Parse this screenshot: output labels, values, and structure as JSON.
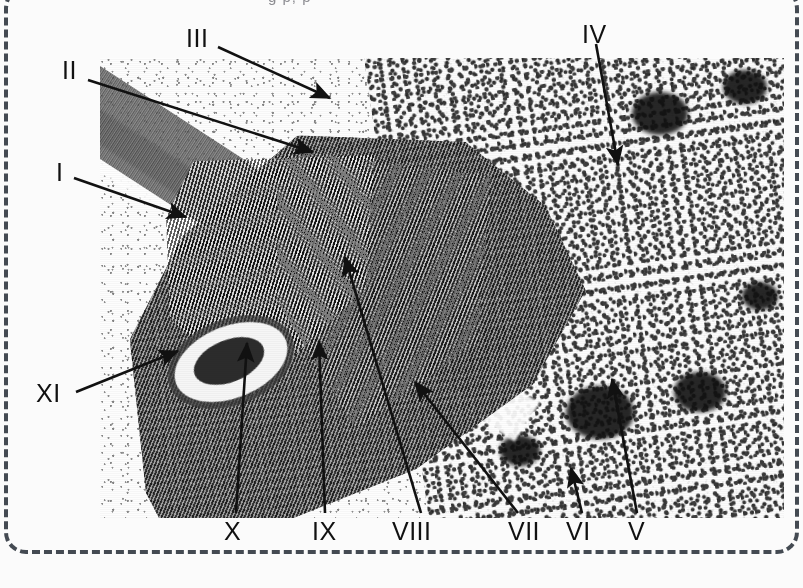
{
  "figure": {
    "kind": "labeled-electron-micrograph",
    "top_caption": "g p, p",
    "border": {
      "style": "dashed",
      "color": "#444a52",
      "corner": "rounded"
    },
    "micrograph": {
      "frame": {
        "x": 100,
        "y": 58,
        "width": 684,
        "height": 460
      },
      "palette": {
        "background": "#fbfbfb",
        "ink": "#111111",
        "film_light": "#fdfdfd",
        "film_dark": "#101010"
      }
    }
  },
  "labels": [
    {
      "id": "III",
      "text": "III",
      "x": 186,
      "y": 26,
      "tip_x": 330,
      "tip_y": 98,
      "anchor_x": 218,
      "anchor_y": 47
    },
    {
      "id": "IV",
      "text": "IV",
      "x": 582,
      "y": 22,
      "tip_x": 618,
      "tip_y": 165,
      "anchor_x": 596,
      "anchor_y": 44
    },
    {
      "id": "II",
      "text": "II",
      "x": 62,
      "y": 58,
      "tip_x": 313,
      "tip_y": 152,
      "anchor_x": 88,
      "anchor_y": 80
    },
    {
      "id": "I",
      "text": "I",
      "x": 56,
      "y": 160,
      "tip_x": 186,
      "tip_y": 217,
      "anchor_x": 74,
      "anchor_y": 178
    },
    {
      "id": "XI",
      "text": "XI",
      "x": 36,
      "y": 381,
      "tip_x": 178,
      "tip_y": 351,
      "anchor_x": 76,
      "anchor_y": 392
    },
    {
      "id": "X",
      "text": "X",
      "x": 224,
      "y": 519,
      "tip_x": 247,
      "tip_y": 343,
      "anchor_x": 236,
      "anchor_y": 513
    },
    {
      "id": "IX",
      "text": "IX",
      "x": 312,
      "y": 519,
      "tip_x": 319,
      "tip_y": 341,
      "anchor_x": 325,
      "anchor_y": 513
    },
    {
      "id": "VIII",
      "text": "VIII",
      "x": 392,
      "y": 519,
      "tip_x": 345,
      "tip_y": 257,
      "anchor_x": 421,
      "anchor_y": 513
    },
    {
      "id": "VII",
      "text": "VII",
      "x": 508,
      "y": 519,
      "tip_x": 415,
      "tip_y": 382,
      "anchor_x": 518,
      "anchor_y": 513
    },
    {
      "id": "VI",
      "text": "VI",
      "x": 566,
      "y": 519,
      "tip_x": 571,
      "tip_y": 468,
      "anchor_x": 582,
      "anchor_y": 513
    },
    {
      "id": "V",
      "text": "V",
      "x": 628,
      "y": 519,
      "tip_x": 612,
      "tip_y": 379,
      "anchor_x": 637,
      "anchor_y": 513
    }
  ],
  "structures": {
    "cell_wall": "banded diagonal cell wall across upper-left",
    "chloroplast": "large crescent chloroplast with parallel grana/thylakoid striations",
    "nucleus": "granular chromatin field filling the right half",
    "nucleoli": [
      {
        "x": 660,
        "y": 120,
        "r": 28
      },
      {
        "x": 745,
        "y": 92,
        "r": 22
      },
      {
        "x": 600,
        "y": 420,
        "r": 34
      },
      {
        "x": 700,
        "y": 398,
        "r": 26
      },
      {
        "x": 520,
        "y": 455,
        "r": 20
      },
      {
        "x": 760,
        "y": 300,
        "r": 18
      }
    ],
    "starch_grain": "oval electron-lucent inclusion at lower-left of chloroplast"
  }
}
